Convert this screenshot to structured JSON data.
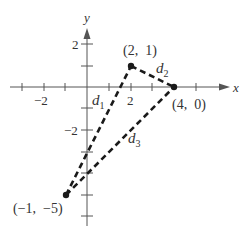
{
  "figure": {
    "axes": {
      "x_label": "x",
      "y_label": "y",
      "x_ticks": [
        -3,
        -2,
        -1,
        1,
        2,
        3,
        4,
        5
      ],
      "x_tick_labels": {
        "-2": "−2",
        "2": "2"
      },
      "y_ticks": [
        2,
        1,
        -1,
        -2,
        -3,
        -4,
        -5,
        -6
      ],
      "y_tick_labels": {
        "2": "2",
        "-2": "−2"
      }
    },
    "points": [
      {
        "id": "A",
        "label": "(2,  1)",
        "x": 2,
        "y": 1
      },
      {
        "id": "B",
        "label": "(4,  0)",
        "x": 4,
        "y": 0
      },
      {
        "id": "C",
        "label": "(−1,  −5)",
        "x": -1,
        "y": -5
      }
    ],
    "segments": [
      {
        "name": "d",
        "sub": "1",
        "from": "C",
        "to": "A"
      },
      {
        "name": "d",
        "sub": "2",
        "from": "A",
        "to": "B"
      },
      {
        "name": "d",
        "sub": "3",
        "from": "C",
        "to": "B"
      }
    ],
    "colors": {
      "axis": "#555555",
      "line": "#1a1a1a",
      "text": "#333333"
    }
  }
}
